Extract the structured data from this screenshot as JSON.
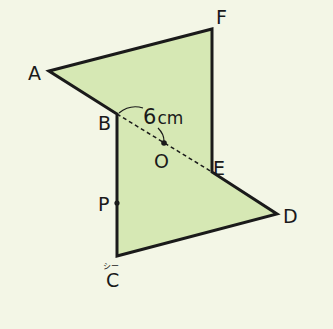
{
  "diagram": {
    "colors": {
      "background": "#f3f6e6",
      "fill": "#d6e8b4",
      "stroke": "#1a1a1a"
    },
    "vertices": {
      "A": {
        "label": "A",
        "x": 49,
        "y": 71
      },
      "B": {
        "label": "B",
        "x": 117,
        "y": 114
      },
      "C": {
        "label": "C",
        "x": 117,
        "y": 256,
        "ruby": "シー"
      },
      "D": {
        "label": "D",
        "x": 277,
        "y": 214
      },
      "E": {
        "label": "E",
        "x": 212,
        "y": 172
      },
      "F": {
        "label": "F",
        "x": 212,
        "y": 29
      }
    },
    "points": {
      "O": {
        "label": "O",
        "x": 164,
        "y": 143
      },
      "P": {
        "label": "P",
        "x": 117,
        "y": 203
      }
    },
    "measurement": {
      "value": "6",
      "unit": "cm",
      "segment": "BO"
    }
  }
}
